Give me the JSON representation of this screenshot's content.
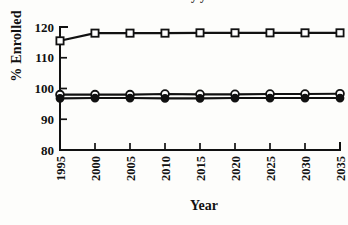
{
  "figure": {
    "title_remnant": "enrollment by year",
    "background_color": "#fdfdfb",
    "ink_color": "#111111"
  },
  "chart_data": {
    "type": "line",
    "title": "",
    "xlabel": "Year",
    "ylabel": "% Enrolled",
    "x": [
      1995,
      2000,
      2005,
      2010,
      2015,
      2020,
      2025,
      2030,
      2035
    ],
    "xtick_labels": [
      "1995",
      "2000",
      "2005",
      "2010",
      "2015",
      "2020",
      "2025",
      "2030",
      "2035"
    ],
    "ytick_labels": [
      "80",
      "90",
      "100",
      "110",
      "120"
    ],
    "yticks": [
      80,
      90,
      100,
      110,
      120
    ],
    "xlim": [
      1995,
      2035
    ],
    "ylim": [
      80,
      120
    ],
    "grid": false,
    "legend": "none",
    "series": [
      {
        "name": "open-square-series",
        "marker": "open-square",
        "values": [
          115.5,
          118.0,
          118.0,
          118.0,
          118.1,
          118.1,
          118.1,
          118.1,
          118.1
        ]
      },
      {
        "name": "open-circle-series",
        "marker": "open-circle",
        "values": [
          98.0,
          98.0,
          98.0,
          98.2,
          98.1,
          98.1,
          98.2,
          98.2,
          98.3
        ]
      },
      {
        "name": "filled-circle-series",
        "marker": "filled-circle",
        "values": [
          96.8,
          96.9,
          96.9,
          96.8,
          96.8,
          96.9,
          96.9,
          96.9,
          96.9
        ]
      }
    ]
  }
}
